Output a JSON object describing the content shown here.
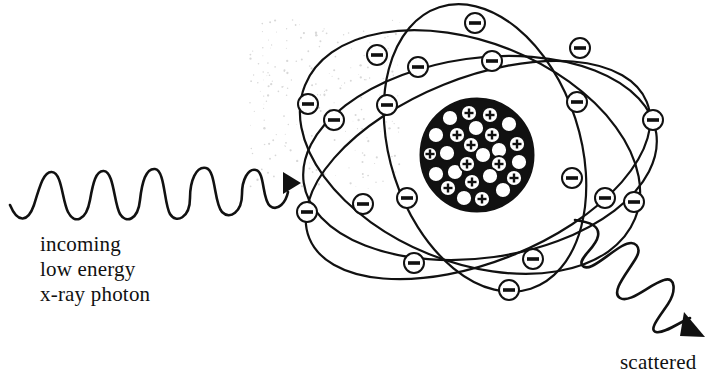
{
  "diagram": {
    "incoming_label": [
      "incoming",
      "low energy",
      "x-ray photon"
    ],
    "outgoing_label_partial": "scattered"
  },
  "colors": {
    "ink": "#111111",
    "background": "#ffffff",
    "speckle": "#d8d8d8"
  },
  "nucleus": {
    "cx": 477,
    "cy": 155,
    "r": 56,
    "proton_symbol": "+",
    "particles": [
      {
        "x": 450,
        "y": 118,
        "r": 8,
        "plus": false
      },
      {
        "x": 469,
        "y": 113,
        "r": 8,
        "plus": true
      },
      {
        "x": 490,
        "y": 115,
        "r": 8,
        "plus": true
      },
      {
        "x": 509,
        "y": 124,
        "r": 8,
        "plus": false
      },
      {
        "x": 436,
        "y": 135,
        "r": 8,
        "plus": false
      },
      {
        "x": 457,
        "y": 135,
        "r": 8,
        "plus": true
      },
      {
        "x": 476,
        "y": 128,
        "r": 8,
        "plus": false
      },
      {
        "x": 492,
        "y": 135,
        "r": 8,
        "plus": true
      },
      {
        "x": 517,
        "y": 144,
        "r": 8,
        "plus": true
      },
      {
        "x": 430,
        "y": 154,
        "r": 7,
        "plus": true
      },
      {
        "x": 447,
        "y": 153,
        "r": 8,
        "plus": false
      },
      {
        "x": 471,
        "y": 145,
        "r": 8,
        "plus": true
      },
      {
        "x": 483,
        "y": 155,
        "r": 8,
        "plus": false
      },
      {
        "x": 499,
        "y": 150,
        "r": 8,
        "plus": false
      },
      {
        "x": 519,
        "y": 162,
        "r": 8,
        "plus": false
      },
      {
        "x": 436,
        "y": 174,
        "r": 8,
        "plus": false
      },
      {
        "x": 455,
        "y": 172,
        "r": 8,
        "plus": false
      },
      {
        "x": 467,
        "y": 164,
        "r": 8,
        "plus": true
      },
      {
        "x": 499,
        "y": 164,
        "r": 8,
        "plus": true
      },
      {
        "x": 514,
        "y": 178,
        "r": 8,
        "plus": true
      },
      {
        "x": 448,
        "y": 188,
        "r": 8,
        "plus": true
      },
      {
        "x": 472,
        "y": 182,
        "r": 8,
        "plus": true
      },
      {
        "x": 490,
        "y": 176,
        "r": 8,
        "plus": false
      },
      {
        "x": 503,
        "y": 190,
        "r": 8,
        "plus": false
      },
      {
        "x": 464,
        "y": 198,
        "r": 8,
        "plus": false
      },
      {
        "x": 482,
        "y": 199,
        "r": 8,
        "plus": true
      }
    ]
  },
  "orbits": [
    {
      "cx": 480,
      "cy": 158,
      "rx": 178,
      "ry": 100,
      "rot": -8
    },
    {
      "cx": 478,
      "cy": 170,
      "rx": 182,
      "ry": 92,
      "rot": -22
    },
    {
      "cx": 470,
      "cy": 152,
      "rx": 178,
      "ry": 110,
      "rot": 22
    },
    {
      "cx": 485,
      "cy": 148,
      "rx": 95,
      "ry": 148,
      "rot": -18
    }
  ],
  "electrons": [
    {
      "x": 377,
      "y": 55
    },
    {
      "x": 418,
      "y": 67
    },
    {
      "x": 475,
      "y": 23
    },
    {
      "x": 492,
      "y": 61
    },
    {
      "x": 580,
      "y": 48
    },
    {
      "x": 308,
      "y": 104
    },
    {
      "x": 334,
      "y": 120
    },
    {
      "x": 387,
      "y": 105
    },
    {
      "x": 577,
      "y": 102
    },
    {
      "x": 653,
      "y": 120
    },
    {
      "x": 407,
      "y": 198
    },
    {
      "x": 363,
      "y": 204
    },
    {
      "x": 307,
      "y": 212
    },
    {
      "x": 572,
      "y": 178
    },
    {
      "x": 605,
      "y": 198
    },
    {
      "x": 634,
      "y": 202
    },
    {
      "x": 414,
      "y": 263
    },
    {
      "x": 533,
      "y": 259
    },
    {
      "x": 509,
      "y": 290
    }
  ],
  "electron_symbol": "−",
  "incoming_photon": {
    "path": "M10,205 C18,224 28,222 34,205 C40,185 44,171 52,172 C62,173 62,200 68,212 C74,224 86,222 90,200 C93,183 96,170 104,171 C114,172 114,204 120,214 C126,224 138,220 140,200 C142,182 146,168 155,169 C165,170 164,204 170,214 C176,224 190,218 190,198 C190,181 196,166 206,168 C216,170 214,204 222,212 C230,220 242,212 242,194 C242,180 248,168 256,170 C265,172 262,200 270,206 C278,212 286,202 288,192",
    "arrow": "M283,172 L301,183 L283,194 Z"
  },
  "outgoing_photon": {
    "path": "M575,220 C590,222 600,226 598,236 C596,248 578,258 582,265 C588,274 605,256 622,246 C636,238 642,248 636,258 C628,272 610,292 620,298 C630,304 650,284 664,280 C676,276 676,292 668,304 C660,316 648,330 656,332 C664,334 680,322 690,318",
    "arrow": "M684,312 L705,337 L680,336 Z"
  }
}
